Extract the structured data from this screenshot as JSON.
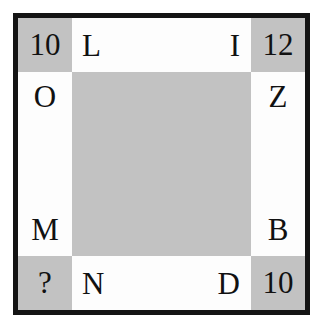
{
  "puzzle": {
    "type": "letter-number-grid",
    "colors": {
      "frame": "#141414",
      "cell_fill": "#c2c2c2",
      "band_fill": "#fdfdfd",
      "text": "#111111"
    },
    "corners": {
      "top_left": "10",
      "top_right": "12",
      "bottom_right": "10",
      "bottom_left": "?"
    },
    "edges": {
      "top_left_letter": "L",
      "top_right_letter": "I",
      "left_top_letter": "O",
      "left_bottom_letter": "M",
      "right_top_letter": "Z",
      "right_bottom_letter": "B",
      "bottom_left_letter": "N",
      "bottom_right_letter": "D"
    },
    "center": ""
  }
}
